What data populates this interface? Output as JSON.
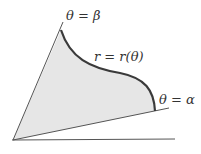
{
  "diagram": {
    "type": "polar-region",
    "labels": {
      "upper_ray": "θ = β",
      "curve": "r = r(θ)",
      "lower_ray": "θ = α"
    },
    "colors": {
      "fill": "#e6e6e6",
      "curve": "#3a3a3a",
      "lines": "#555555",
      "text": "#333333"
    }
  }
}
